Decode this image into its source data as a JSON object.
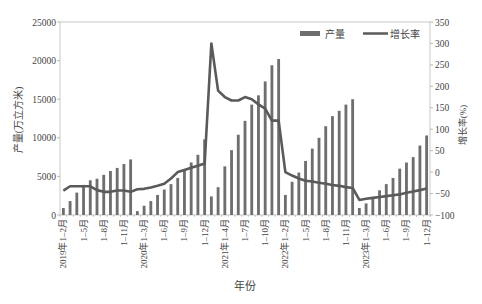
{
  "chart_data": {
    "type": "bar+line",
    "title": "",
    "xlabel": "年份",
    "ylabel_left": "产量(万立方米)",
    "ylabel_right": "增长率(%)",
    "ylim_left": [
      0,
      25000
    ],
    "ylim_right": [
      -100,
      350
    ],
    "yticks_left": [
      0,
      5000,
      10000,
      15000,
      20000,
      25000
    ],
    "yticks_right": [
      -100,
      -50,
      0,
      50,
      100,
      150,
      200,
      250,
      300,
      350
    ],
    "grid": false,
    "legend": {
      "position": "top-right",
      "entries": [
        "产量",
        "增长率"
      ]
    },
    "colors": {
      "bar": "#6e6e6e",
      "line": "#5a5a5a",
      "axis": "#aaaaaa"
    },
    "categories": [
      "2019年1-2月",
      "1-3月",
      "1-4月",
      "1-5月",
      "1-6月",
      "1-7月",
      "1-8月",
      "1-9月",
      "1-10月",
      "1-11月",
      "1-12月",
      "2020年1-2月",
      "1-3月",
      "1-4月",
      "1-5月",
      "1-6月",
      "1-7月",
      "1-8月",
      "1-9月",
      "1-10月",
      "1-11月",
      "1-12月",
      "2021年1-2月",
      "1-3月",
      "1-4月",
      "1-5月",
      "1-6月",
      "1-7月",
      "1-8月",
      "1-9月",
      "1-10月",
      "1-11月",
      "1-12月",
      "2022年1-2月",
      "1-3月",
      "1-4月",
      "1-5月",
      "1-6月",
      "1-7月",
      "1-8月",
      "1-9月",
      "1-10月",
      "1-11月",
      "1-12月",
      "2023年1-2月",
      "1-3月",
      "1-4月",
      "1-5月",
      "1-6月",
      "1-7月",
      "1-8月",
      "1-9月",
      "1-10月",
      "1-11月",
      "1-12月"
    ],
    "tick_labels": [
      {
        "index": 0,
        "label": "2019年1-2月"
      },
      {
        "index": 3,
        "label": "1-5月"
      },
      {
        "index": 6,
        "label": "1-8月"
      },
      {
        "index": 9,
        "label": "1-11月"
      },
      {
        "index": 12,
        "label": "2020年1-3月"
      },
      {
        "index": 15,
        "label": "1-6月"
      },
      {
        "index": 18,
        "label": "1-9月"
      },
      {
        "index": 21,
        "label": "1-12月"
      },
      {
        "index": 24,
        "label": "2021年1-4月"
      },
      {
        "index": 27,
        "label": "1-7月"
      },
      {
        "index": 30,
        "label": "1-10月"
      },
      {
        "index": 33,
        "label": "2022年1-2月"
      },
      {
        "index": 36,
        "label": "1-5月"
      },
      {
        "index": 39,
        "label": "1-8月"
      },
      {
        "index": 42,
        "label": "1-11月"
      },
      {
        "index": 45,
        "label": "2023年1-3月"
      },
      {
        "index": 48,
        "label": "1-6月"
      },
      {
        "index": 51,
        "label": "1-9月"
      },
      {
        "index": 54,
        "label": "1-12月"
      }
    ],
    "series": [
      {
        "name": "产量",
        "type": "bar",
        "axis": "left",
        "values": [
          900,
          1800,
          2900,
          3900,
          4500,
          4700,
          5200,
          5700,
          6100,
          6600,
          7200,
          500,
          1200,
          1800,
          2600,
          3300,
          4000,
          4800,
          5900,
          6800,
          7800,
          9800,
          2400,
          3600,
          6300,
          8400,
          10400,
          12200,
          14300,
          15500,
          17300,
          19400,
          20200,
          2600,
          4300,
          5500,
          7000,
          8600,
          10000,
          11500,
          12800,
          13500,
          14300,
          15000,
          900,
          1500,
          2200,
          3200,
          4000,
          4800,
          6000,
          6800,
          7500,
          9000,
          10300
        ]
      },
      {
        "name": "增长率",
        "type": "line",
        "axis": "right",
        "values": [
          -43,
          -33,
          -33,
          -33,
          -33,
          -42,
          -46,
          -46,
          -43,
          -43,
          -46,
          -40,
          -39,
          -36,
          -32,
          -27,
          -15,
          0,
          5,
          10,
          15,
          20,
          300,
          190,
          175,
          167,
          167,
          175,
          170,
          158,
          148,
          120,
          120,
          0,
          -8,
          -15,
          -20,
          -22,
          -25,
          -27,
          -30,
          -32,
          -35,
          -37,
          -65,
          -62,
          -60,
          -58,
          -56,
          -54,
          -52,
          -48,
          -45,
          -42,
          -38
        ]
      }
    ]
  }
}
